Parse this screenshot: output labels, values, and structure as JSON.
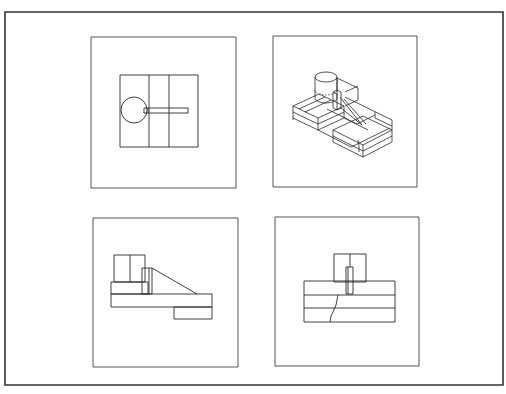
{
  "drawing": {
    "title": "",
    "colors": {
      "line": "#2a2a2a",
      "frame": "#333333",
      "panel": "#555555",
      "background": "#ffffff"
    },
    "frame": {
      "x": 5,
      "y": 12,
      "w": 498,
      "h": 373
    },
    "views": [
      {
        "id": "top-view",
        "label": "Top view (plan)",
        "panel": {
          "x": 91,
          "y": 37,
          "w": 145,
          "h": 151
        }
      },
      {
        "id": "isometric-view",
        "label": "Isometric view",
        "panel": {
          "x": 273,
          "y": 36,
          "w": 144,
          "h": 151
        }
      },
      {
        "id": "front-view",
        "label": "Front view (elevation)",
        "panel": {
          "x": 93,
          "y": 218,
          "w": 145,
          "h": 149
        }
      },
      {
        "id": "side-view",
        "label": "Side view (sectioned)",
        "panel": {
          "x": 275,
          "y": 217,
          "w": 144,
          "h": 149
        }
      }
    ]
  }
}
